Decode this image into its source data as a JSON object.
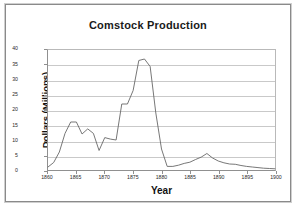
{
  "chart_data": {
    "type": "line",
    "title": "Comstock Production",
    "xlabel": "Year",
    "ylabel": "Dollars (Millions)",
    "xlim": [
      1860,
      1900
    ],
    "ylim": [
      0,
      40
    ],
    "grid": true,
    "legend": false,
    "xticks": [
      1860,
      1865,
      1870,
      1875,
      1880,
      1885,
      1890,
      1895,
      1900
    ],
    "yticks": [
      0,
      5,
      10,
      15,
      20,
      25,
      30,
      35,
      40
    ],
    "x": [
      1860,
      1861,
      1862,
      1863,
      1864,
      1865,
      1866,
      1867,
      1868,
      1869,
      1870,
      1871,
      1872,
      1873,
      1874,
      1875,
      1876,
      1877,
      1878,
      1879,
      1880,
      1881,
      1882,
      1883,
      1884,
      1885,
      1886,
      1887,
      1888,
      1889,
      1890,
      1891,
      1892,
      1893,
      1894,
      1895,
      1896,
      1897,
      1898,
      1899,
      1900
    ],
    "values": [
      1.0,
      2.5,
      6.0,
      12.2,
      16.0,
      16.0,
      12.0,
      13.7,
      12.2,
      6.5,
      10.8,
      10.3,
      10.0,
      22.0,
      22.0,
      26.5,
      36.5,
      37.0,
      34.5,
      19.0,
      7.0,
      1.2,
      1.2,
      1.6,
      2.2,
      2.6,
      3.5,
      4.3,
      5.5,
      4.0,
      3.0,
      2.4,
      2.0,
      1.9,
      1.5,
      1.2,
      1.0,
      0.8,
      0.6,
      0.5,
      0.4
    ],
    "series_name": "Comstock Production"
  },
  "chart": {
    "title": "Comstock Production",
    "xlabel": "Year",
    "ylabel": "Dollars (Millions)"
  }
}
